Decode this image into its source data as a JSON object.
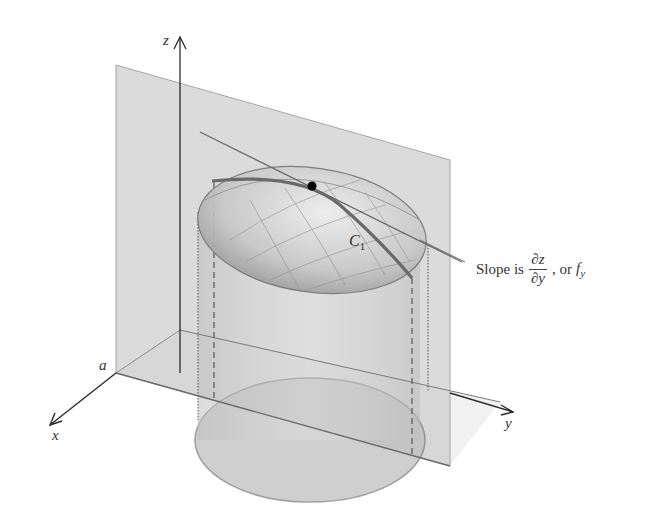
{
  "figure": {
    "axes": {
      "z_label": "z",
      "x_label": "x",
      "y_label": "y",
      "a_label": "a"
    },
    "curve_label": {
      "main": "C",
      "sub": "1"
    },
    "caption": {
      "prefix": "Slope is",
      "frac_num": "∂z",
      "frac_den": "∂y",
      "middle": ", or",
      "f_main": "f",
      "f_sub": "y"
    },
    "colors": {
      "plane": "#c9c9c9",
      "surface": "#bdbdbd",
      "curve": "#6e6e6e",
      "axis": "#2a2a2a",
      "point": "#000000"
    }
  }
}
